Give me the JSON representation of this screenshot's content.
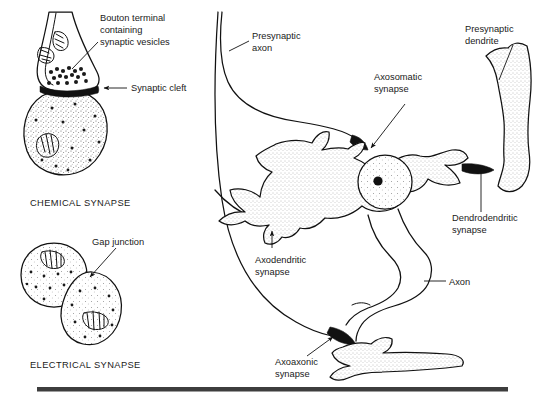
{
  "figure": {
    "title_visible": false,
    "background_color": "#ffffff",
    "ink_color": "#111111",
    "cytoplasm_fill": "#e8e8e8",
    "panels": [
      {
        "id": "chemical-synapse",
        "caption": "CHEMICAL SYNAPSE",
        "labels": [
          {
            "id": "bouton-terminal",
            "text_lines": [
              "Bouton terminal",
              "containing",
              "synaptic vesicles"
            ]
          },
          {
            "id": "synaptic-cleft",
            "text_lines": [
              "Synaptic cleft"
            ]
          }
        ]
      },
      {
        "id": "electrical-synapse",
        "caption": "ELECTRICAL SYNAPSE",
        "labels": [
          {
            "id": "gap-junction",
            "text_lines": [
              "Gap junction"
            ]
          }
        ]
      },
      {
        "id": "neuron-synapse-types",
        "caption": "",
        "labels": [
          {
            "id": "presynaptic-axon",
            "text_lines": [
              "Presynaptic",
              "axon"
            ]
          },
          {
            "id": "axosomatic-synapse",
            "text_lines": [
              "Axosomatic",
              "synapse"
            ]
          },
          {
            "id": "presynaptic-dendrite",
            "text_lines": [
              "Presynaptic",
              "dendrite"
            ]
          },
          {
            "id": "dendrodendritic-synapse",
            "text_lines": [
              "Dendrodendritic",
              "synapse"
            ]
          },
          {
            "id": "axodendritic-synapse",
            "text_lines": [
              "Axodendritic",
              "synapse"
            ]
          },
          {
            "id": "axon",
            "text_lines": [
              "Axon"
            ]
          },
          {
            "id": "axoaxonic-synapse",
            "text_lines": [
              "Axoaxonic",
              "synapse"
            ]
          }
        ]
      }
    ],
    "labels": {
      "bouton_line1": "Bouton terminal",
      "bouton_line2": "containing",
      "bouton_line3": "synaptic vesicles",
      "synaptic_cleft": "Synaptic cleft",
      "chemical_synapse_caption": "CHEMICAL SYNAPSE",
      "gap_junction": "Gap junction",
      "electrical_synapse_caption": "ELECTRICAL SYNAPSE",
      "presynaptic_axon_line1": "Presynaptic",
      "presynaptic_axon_line2": "axon",
      "axosomatic_line1": "Axosomatic",
      "axosomatic_line2": "synapse",
      "presynaptic_dendrite_line1": "Presynaptic",
      "presynaptic_dendrite_line2": "dendrite",
      "dendrodendritic_line1": "Dendrodendritic",
      "dendrodendritic_line2": "synapse",
      "axodendritic_line1": "Axodendritic",
      "axodendritic_line2": "synapse",
      "axon": "Axon",
      "axoaxonic_line1": "Axoaxonic",
      "axoaxonic_line2": "synapse"
    },
    "footer_rule": {
      "present": true,
      "color": "#3d3d3d"
    }
  }
}
